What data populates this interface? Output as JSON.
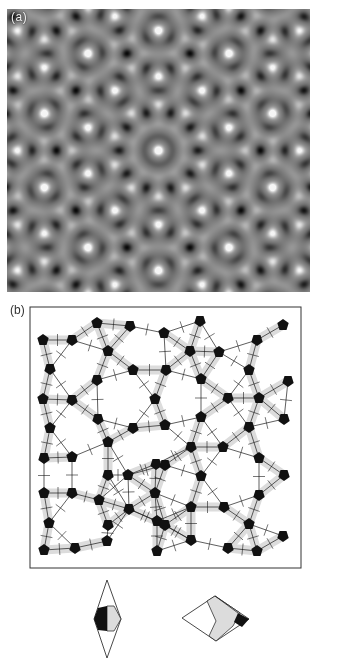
{
  "figure": {
    "panel_a": {
      "label": "(a)",
      "description": "High-resolution electron micrograph of decagonal quasicrystal",
      "pattern": {
        "symmetry": 10,
        "wavelength_px": 23,
        "contrast": 1.0,
        "background": "#7f7f7f"
      }
    },
    "panel_b": {
      "label": "(b)",
      "description": "Penrose tiling model with decorated rhombi",
      "box": {
        "x": 30,
        "y": 307,
        "w": 271,
        "h": 261
      },
      "colors": {
        "line": "#1a1a1a",
        "fill_grey": "#dcdcdc",
        "fill_black": "#111111"
      },
      "pentagons": [
        [
          97,
          323
        ],
        [
          130,
          326
        ],
        [
          164,
          333
        ],
        [
          200,
          321
        ],
        [
          283,
          325
        ],
        [
          257,
          340
        ],
        [
          43,
          340
        ],
        [
          72,
          340
        ],
        [
          108,
          351
        ],
        [
          190,
          351
        ],
        [
          219,
          352
        ],
        [
          50,
          369
        ],
        [
          133,
          370
        ],
        [
          166,
          370
        ],
        [
          249,
          370
        ],
        [
          97,
          380
        ],
        [
          201,
          379
        ],
        [
          288,
          381
        ],
        [
          43,
          399
        ],
        [
          72,
          400
        ],
        [
          155,
          399
        ],
        [
          228,
          398
        ],
        [
          259,
          398
        ],
        [
          98,
          419
        ],
        [
          201,
          417
        ],
        [
          284,
          419
        ],
        [
          50,
          428
        ],
        [
          133,
          428
        ],
        [
          165,
          425
        ],
        [
          249,
          427
        ],
        [
          108,
          442
        ],
        [
          191,
          447
        ],
        [
          223,
          447
        ],
        [
          44,
          458
        ],
        [
          72,
          457
        ],
        [
          156,
          464
        ],
        [
          259,
          458
        ],
        [
          108,
          475
        ],
        [
          128,
          475
        ],
        [
          165,
          465
        ],
        [
          201,
          476
        ],
        [
          284,
          475
        ],
        [
          44,
          493
        ],
        [
          72,
          493
        ],
        [
          155,
          493
        ],
        [
          259,
          495
        ],
        [
          99,
          500
        ],
        [
          129,
          509
        ],
        [
          191,
          507
        ],
        [
          224,
          507
        ],
        [
          49,
          523
        ],
        [
          108,
          525
        ],
        [
          157,
          521
        ],
        [
          165,
          525
        ],
        [
          249,
          524
        ],
        [
          283,
          536
        ],
        [
          107,
          541
        ],
        [
          191,
          540
        ],
        [
          44,
          550
        ],
        [
          75,
          548
        ],
        [
          157,
          551
        ],
        [
          228,
          548
        ],
        [
          257,
          551
        ]
      ]
    },
    "tiles": {
      "thin_rhombus": {
        "points": [
          [
            107,
            580
          ],
          [
            121,
            619
          ],
          [
            107,
            658
          ],
          [
            94,
            619
          ]
        ]
      },
      "fat_rhombus": {
        "points": [
          [
            182,
            618
          ],
          [
            215,
            596
          ],
          [
            249,
            619
          ],
          [
            216,
            641
          ]
        ]
      }
    }
  }
}
